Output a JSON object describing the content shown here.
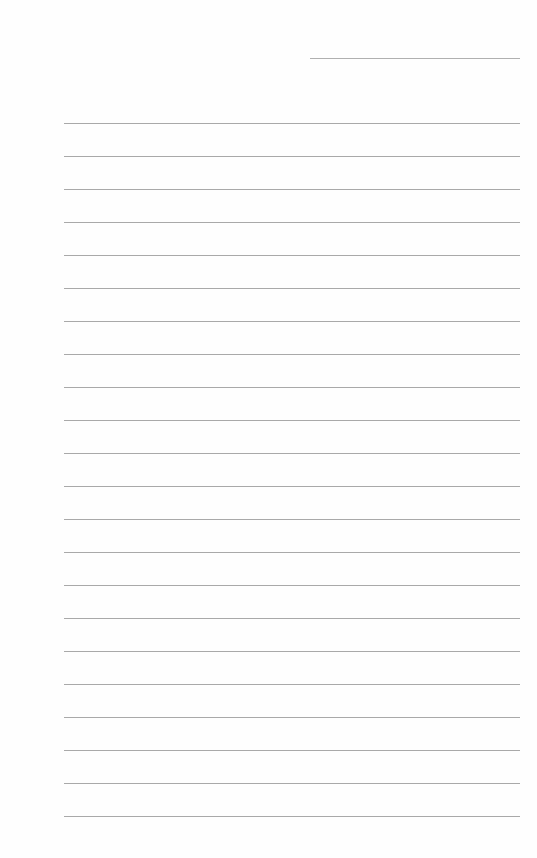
{
  "page": {
    "type": "lined-notebook-page",
    "background_color": "#ffffff",
    "line_color": "#a9a9a9",
    "header_line": {
      "x": 310,
      "y": 58,
      "width": 210
    },
    "ruled_lines": {
      "count": 22,
      "start_y": 123,
      "spacing": 33,
      "x": 64,
      "width": 456
    }
  }
}
